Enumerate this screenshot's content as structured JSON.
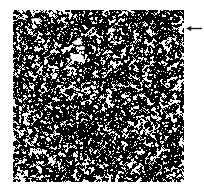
{
  "figure": {
    "kind": "speckle-noise-micrograph",
    "background_color": "#ffffff",
    "panel": {
      "label": "",
      "x": 13,
      "y": 10,
      "width": 171,
      "height": 172,
      "foreground_color": "#ffffff",
      "background_color": "#000000",
      "border": "none"
    },
    "annotation": {
      "arrow_label": "",
      "direction": "left",
      "x": 186,
      "y": 22,
      "length": 17,
      "color": "#1a1a1a"
    }
  },
  "chart_data": {
    "type": "heatmap",
    "title": "",
    "subtitle": "",
    "xlabel": "",
    "ylabel": "",
    "legend": [],
    "annotations": [
      {
        "text": "",
        "marker": "left-arrow",
        "target": "noise-panel-right-edge",
        "x": 186,
        "y": 28
      }
    ],
    "grid": false,
    "colormap": [
      "#000000",
      "#ffffff"
    ],
    "value_range": [
      0,
      1
    ],
    "pixel_size": 1,
    "width_px": 171,
    "height_px": 172,
    "white_fraction": 0.33,
    "density_field": {
      "nx": 8,
      "ny": 8,
      "values": [
        [
          0.34,
          0.31,
          0.3,
          0.33,
          0.32,
          0.3,
          0.31,
          0.33
        ],
        [
          0.33,
          0.36,
          0.38,
          0.34,
          0.31,
          0.3,
          0.32,
          0.34
        ],
        [
          0.32,
          0.35,
          0.4,
          0.36,
          0.33,
          0.31,
          0.3,
          0.32
        ],
        [
          0.31,
          0.33,
          0.34,
          0.32,
          0.31,
          0.32,
          0.33,
          0.34
        ],
        [
          0.33,
          0.32,
          0.31,
          0.3,
          0.32,
          0.34,
          0.35,
          0.33
        ],
        [
          0.35,
          0.34,
          0.32,
          0.31,
          0.33,
          0.35,
          0.34,
          0.32
        ],
        [
          0.37,
          0.36,
          0.34,
          0.33,
          0.34,
          0.33,
          0.31,
          0.3
        ],
        [
          0.36,
          0.35,
          0.33,
          0.32,
          0.33,
          0.32,
          0.3,
          0.29
        ]
      ]
    }
  }
}
